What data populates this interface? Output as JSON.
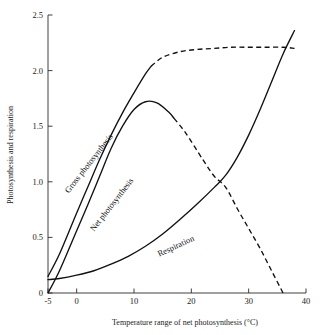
{
  "chart_data": {
    "type": "line",
    "title": "",
    "xlabel": "Temperature range of net photosynthesis (°C)",
    "ylabel": "Photosynthesis and respiration",
    "xlim": [
      -5,
      40
    ],
    "ylim": [
      0,
      2.5
    ],
    "grid": false,
    "legend_position": "inline-curve-labels",
    "xticks": [
      -5,
      0,
      10,
      20,
      30,
      40
    ],
    "xtick_labels": [
      "-5",
      "0",
      "10",
      "20",
      "30",
      "40"
    ],
    "yticks": [
      0,
      0.5,
      1.0,
      1.5,
      2.0,
      2.5
    ],
    "ytick_labels": [
      "0",
      "0.5",
      "1.0",
      "1.5",
      "2.0",
      "2.5"
    ],
    "series": [
      {
        "name": "Gross photosynthesis",
        "label": "Gross photosynthesis",
        "style": "solid-then-dashed",
        "solid_dashed_break_x": 13,
        "x": [
          -5,
          -3,
          0,
          2,
          4,
          6,
          8,
          10,
          12,
          13,
          15,
          18,
          21,
          24,
          27,
          30,
          33,
          36,
          38
        ],
        "y": [
          0.15,
          0.35,
          0.72,
          0.96,
          1.2,
          1.42,
          1.62,
          1.8,
          1.97,
          2.04,
          2.12,
          2.17,
          2.19,
          2.2,
          2.21,
          2.21,
          2.21,
          2.21,
          2.2
        ]
      },
      {
        "name": "Net photosynthesis",
        "label": "Net photosynthesis",
        "style": "solid-then-dashed",
        "solid_dashed_break_x": 17,
        "x": [
          -5,
          -3,
          0,
          2,
          4,
          6,
          8,
          10,
          12,
          14,
          16,
          17,
          19,
          22,
          24,
          26,
          28,
          30,
          32,
          34,
          36
        ],
        "y": [
          0.0,
          0.2,
          0.56,
          0.8,
          1.05,
          1.3,
          1.5,
          1.65,
          1.72,
          1.71,
          1.63,
          1.57,
          1.44,
          1.2,
          1.05,
          0.95,
          0.76,
          0.58,
          0.4,
          0.2,
          0.0
        ]
      },
      {
        "name": "Respiration",
        "label": "Respiration",
        "style": "solid",
        "x": [
          -5,
          -3,
          0,
          3,
          6,
          9,
          12,
          15,
          18,
          21,
          24,
          26,
          28,
          30,
          32,
          34,
          36,
          38
        ],
        "y": [
          0.12,
          0.13,
          0.16,
          0.2,
          0.26,
          0.33,
          0.42,
          0.53,
          0.66,
          0.8,
          0.95,
          1.06,
          1.22,
          1.42,
          1.65,
          1.9,
          2.15,
          2.36
        ]
      }
    ],
    "annotations": [
      {
        "text": "Gross photosynthesis",
        "x": 2.5,
        "y": 1.15
      },
      {
        "text": "Net photosynthesis",
        "x": 6.5,
        "y": 0.78
      },
      {
        "text": "Respiration",
        "x": 17.5,
        "y": 0.4
      }
    ],
    "colors": {
      "curve": "#111111",
      "axis": "#2b2b2b",
      "background": "#ffffff"
    }
  }
}
